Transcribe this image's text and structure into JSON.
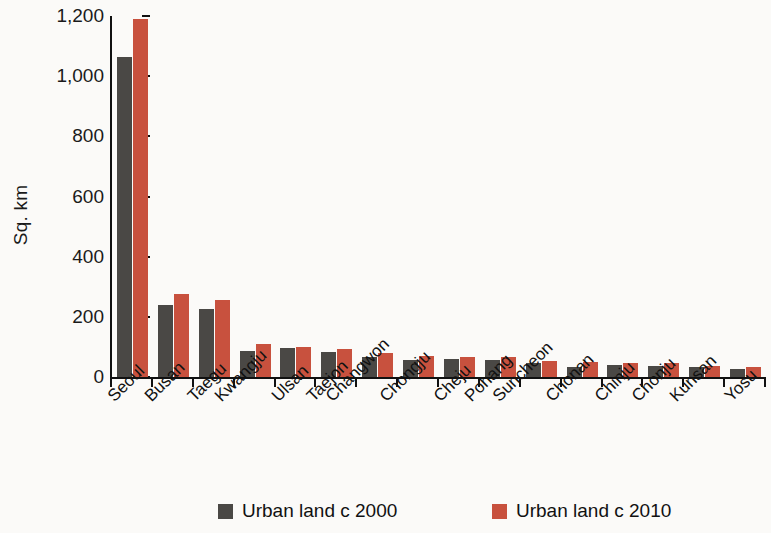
{
  "chart_data": {
    "type": "bar",
    "title": "",
    "xlabel": "",
    "ylabel": "Sq. km",
    "ylim": [
      0,
      1200
    ],
    "yticks": [
      0,
      200,
      400,
      600,
      800,
      1000,
      1200
    ],
    "ytick_labels": [
      "0",
      "200",
      "400",
      "600",
      "800",
      "1,000",
      "1,200"
    ],
    "grid": false,
    "legend_position": "bottom",
    "categories": [
      "Seoul",
      "Busan",
      "Taegu",
      "Kwangju",
      "Ulsan",
      "Taejon",
      "Changwon",
      "Chongju",
      "Cheju",
      "Pohang",
      "Suncheon",
      "Chonan",
      "Chinju",
      "Chonju",
      "Kunsan",
      "Yosu"
    ],
    "series": [
      {
        "name": "Urban land c 2000",
        "color": "#4a4845",
        "values": [
          1065,
          240,
          225,
          88,
          95,
          82,
          68,
          58,
          60,
          56,
          45,
          34,
          41,
          38,
          32,
          26
        ]
      },
      {
        "name": "Urban land c 2010",
        "color": "#c8513e",
        "values": [
          1190,
          277,
          257,
          110,
          100,
          92,
          80,
          70,
          66,
          65,
          52,
          50,
          45,
          45,
          38,
          32
        ]
      }
    ]
  },
  "legend": {
    "items": [
      {
        "label": "Urban land c 2000",
        "color": "#4a4845"
      },
      {
        "label": "Urban land c 2010",
        "color": "#c8513e"
      }
    ]
  }
}
